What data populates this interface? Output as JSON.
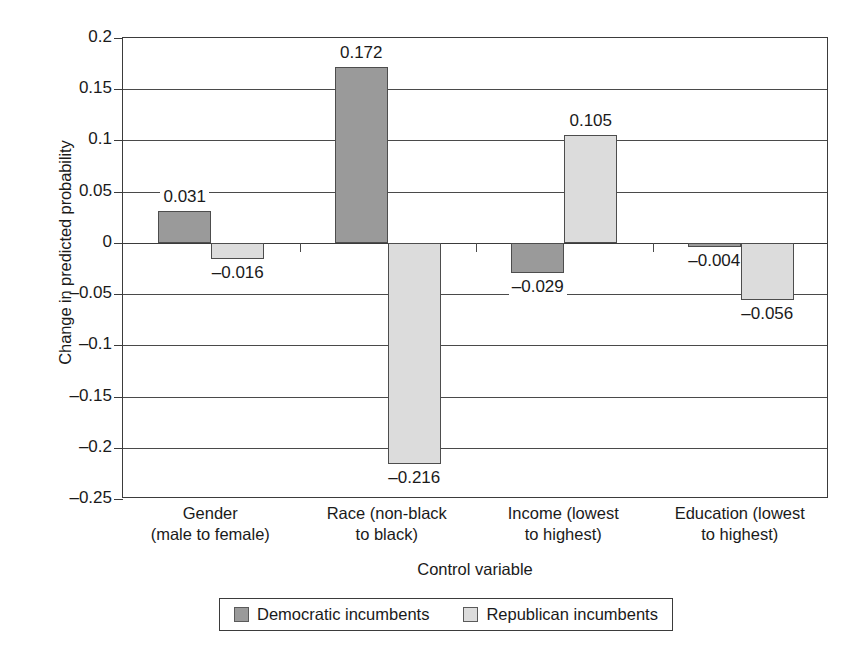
{
  "chart_data": {
    "type": "bar",
    "title": "",
    "xlabel": "Control variable",
    "ylabel": "Change in predicted probability",
    "categories": [
      "Gender (male to female)",
      "Race (non-black to black)",
      "Income (lowest to highest)",
      "Education (lowest to highest)"
    ],
    "category_lines": [
      [
        "Gender",
        "(male to female)"
      ],
      [
        "Race (non-black",
        "to black)"
      ],
      [
        "Income (lowest",
        "to highest)"
      ],
      [
        "Education (lowest",
        "to highest)"
      ]
    ],
    "series": [
      {
        "name": "Democratic incumbents",
        "color": "#9a9a9a",
        "values": [
          0.031,
          0.172,
          -0.029,
          -0.004
        ],
        "labels": [
          "0.031",
          "0.172",
          "–0.029",
          "–0.004"
        ]
      },
      {
        "name": "Republican incumbents",
        "color": "#dcdcdc",
        "values": [
          -0.016,
          -0.216,
          0.105,
          -0.056
        ],
        "labels": [
          "–0.016",
          "–0.216",
          "0.105",
          "–0.056"
        ]
      }
    ],
    "ylim": [
      -0.25,
      0.2
    ],
    "ytick_values": [
      0.2,
      0.15,
      0.1,
      0.05,
      0,
      -0.05,
      -0.1,
      -0.15,
      -0.2,
      -0.25
    ],
    "ytick_labels": [
      "0.2",
      "0.15",
      "0.1",
      "0.05",
      "0",
      "–0.05",
      "–0.1",
      "–0.15",
      "–0.2",
      "–0.25"
    ],
    "grid": true,
    "legend_position": "bottom"
  },
  "legend": {
    "entries": [
      {
        "label": "Democratic incumbents"
      },
      {
        "label": "Republican incumbents"
      }
    ]
  }
}
